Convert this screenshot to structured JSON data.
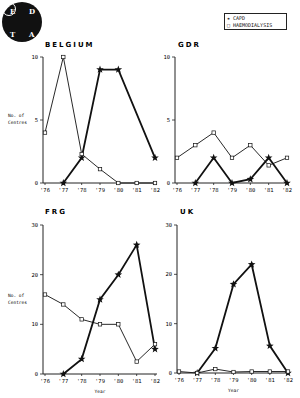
{
  "logo": {
    "letters": [
      "E",
      "D",
      "T",
      "A"
    ]
  },
  "legend": {
    "capd": "CAPD",
    "haemodialysis": "Haemodialysis",
    "capd_symbol": "★",
    "hd_symbol": "□"
  },
  "ylabel_line1": "No. of",
  "ylabel_line2": "Centres",
  "xlabel": "Year",
  "chart_data": [
    {
      "type": "line",
      "title": "BELGIUM",
      "x": [
        "'76",
        "'77",
        "'78",
        "'79",
        "'80",
        "'81",
        "'82"
      ],
      "ylim": [
        0,
        10
      ],
      "yticks": [
        0,
        5,
        10
      ],
      "ylabel": "No. of Centres",
      "xlabel": "",
      "series": [
        {
          "name": "CAPD",
          "values": [
            null,
            0,
            2,
            9,
            9,
            null,
            2
          ]
        },
        {
          "name": "Haemodialysis",
          "values": [
            4,
            10,
            2.3,
            1.1,
            0,
            0,
            0
          ]
        }
      ]
    },
    {
      "type": "line",
      "title": "GDR",
      "x": [
        "'76",
        "'77",
        "'78",
        "'79",
        "'80",
        "'81",
        "'82"
      ],
      "ylim": [
        0,
        10
      ],
      "yticks": [
        0,
        5,
        10
      ],
      "ylabel": "",
      "xlabel": "",
      "series": [
        {
          "name": "CAPD",
          "values": [
            null,
            0,
            2,
            0,
            0.3,
            2,
            0
          ]
        },
        {
          "name": "Haemodialysis",
          "values": [
            2,
            3,
            4,
            2,
            3,
            1.4,
            2
          ]
        }
      ]
    },
    {
      "type": "line",
      "title": "FRG",
      "x": [
        "'76",
        "'77",
        "'78",
        "'79",
        "'80",
        "'81",
        "'82"
      ],
      "ylim": [
        0,
        30
      ],
      "yticks": [
        0,
        10,
        20,
        30
      ],
      "ylabel": "No. of Centres",
      "xlabel": "Year",
      "series": [
        {
          "name": "CAPD",
          "values": [
            null,
            0,
            3,
            15,
            20,
            26,
            5
          ]
        },
        {
          "name": "Haemodialysis",
          "values": [
            16,
            14,
            11,
            10,
            10,
            2.5,
            6
          ]
        }
      ]
    },
    {
      "type": "line",
      "title": "UK",
      "x": [
        "'76",
        "'77",
        "'78",
        "'79",
        "'80",
        "'81",
        "'82"
      ],
      "ylim": [
        0,
        30
      ],
      "yticks": [
        0,
        10,
        20,
        30
      ],
      "ylabel": "",
      "xlabel": "Year",
      "series": [
        {
          "name": "CAPD",
          "values": [
            null,
            0,
            5,
            18,
            22,
            5.5,
            0
          ]
        },
        {
          "name": "Haemodialysis",
          "values": [
            0.3,
            0,
            0.8,
            0.2,
            0.3,
            0.3,
            0.3
          ]
        }
      ]
    }
  ]
}
